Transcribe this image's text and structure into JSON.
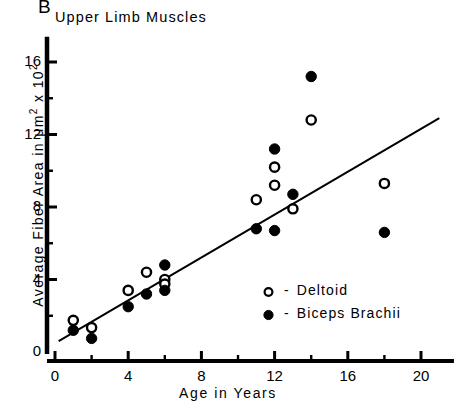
{
  "figure": {
    "panel_label": "B",
    "title": "Upper Limb Muscles",
    "background_color": "#ffffff",
    "ink_color": "#000000"
  },
  "chart_data": {
    "type": "scatter",
    "title": "Upper Limb Muscles",
    "panel": "B",
    "xlabel": "Age in Years",
    "ylabel": "Average Fiber Area in μm² x 10²",
    "xlim": [
      0,
      21.8
    ],
    "ylim": [
      0,
      17.4
    ],
    "xticks": [
      0,
      4,
      8,
      12,
      16,
      20
    ],
    "xtick_labels": [
      "0",
      "4",
      "8",
      "12",
      "16",
      "20"
    ],
    "x_minor_tick_interval": 2,
    "yticks": [
      0,
      4,
      8,
      12,
      16
    ],
    "ytick_labels": [
      "0",
      "4",
      "8",
      "12",
      "16"
    ],
    "y_minor_tick_interval": 2,
    "grid": false,
    "legend_position": "inside-lower-right",
    "series": [
      {
        "name": "Deltoid",
        "marker": "open-circle",
        "color": "#000000",
        "points": [
          {
            "x": 1,
            "y": 1.75
          },
          {
            "x": 2,
            "y": 1.35
          },
          {
            "x": 4,
            "y": 3.4
          },
          {
            "x": 5,
            "y": 4.4
          },
          {
            "x": 6,
            "y": 4.0
          },
          {
            "x": 6,
            "y": 3.75
          },
          {
            "x": 11,
            "y": 8.4
          },
          {
            "x": 12,
            "y": 10.2
          },
          {
            "x": 12,
            "y": 9.2
          },
          {
            "x": 13,
            "y": 7.9
          },
          {
            "x": 14,
            "y": 12.8
          },
          {
            "x": 18,
            "y": 9.3
          }
        ]
      },
      {
        "name": "Biceps Brachii",
        "marker": "filled-circle",
        "color": "#000000",
        "points": [
          {
            "x": 1,
            "y": 1.2
          },
          {
            "x": 2,
            "y": 0.75
          },
          {
            "x": 4,
            "y": 2.5
          },
          {
            "x": 5,
            "y": 3.2
          },
          {
            "x": 6,
            "y": 4.8
          },
          {
            "x": 6,
            "y": 3.4
          },
          {
            "x": 11,
            "y": 6.8
          },
          {
            "x": 12,
            "y": 11.2
          },
          {
            "x": 12,
            "y": 6.7
          },
          {
            "x": 13,
            "y": 8.7
          },
          {
            "x": 14,
            "y": 15.2
          },
          {
            "x": 18,
            "y": 6.6
          }
        ]
      }
    ],
    "trendline": {
      "type": "linear-regression",
      "x_start": 0.2,
      "y_start": 0.6,
      "x_end": 21.0,
      "y_end": 12.9
    },
    "legend": [
      {
        "marker": "open-circle",
        "dash": "-",
        "label": "Deltoid"
      },
      {
        "marker": "filled-circle",
        "dash": "-",
        "label": "Biceps Brachii"
      }
    ]
  }
}
